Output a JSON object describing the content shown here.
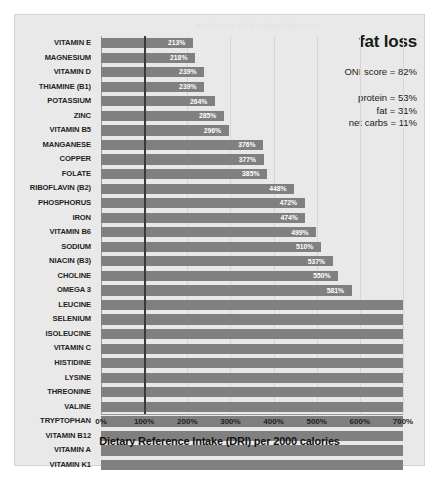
{
  "watermark": "nutrEbooters @ OptimisingNutrition.com",
  "annotations": {
    "title": "fat loss",
    "oni_score": "ONI score = 82%",
    "protein": "protein = 53%",
    "fat": "fat = 31%",
    "net_carbs": "net carbs = 11%"
  },
  "chart_data": {
    "type": "bar",
    "orientation": "horizontal",
    "title": "",
    "xlabel": "Dietary Reference Intake (DRI) per 2000 calories",
    "ylabel": "",
    "xlim": [
      0,
      700
    ],
    "grid": true,
    "reference_line": 100,
    "tick_labels": [
      "0%",
      "100%",
      "200%",
      "300%",
      "400%",
      "500%",
      "600%",
      "700%"
    ],
    "ticks": [
      0,
      100,
      200,
      300,
      400,
      500,
      600,
      700
    ],
    "bar_color": "#808080",
    "label_color": "#ffffff",
    "categories": [
      "VITAMIN E",
      "MAGNESIUM",
      "VITAMIN D",
      "THIAMINE (B1)",
      "POTASSIUM",
      "ZINC",
      "VITAMIN B5",
      "MANGANESE",
      "COPPER",
      "FOLATE",
      "RIBOFLAVIN (B2)",
      "PHOSPHORUS",
      "IRON",
      "VITAMIN B6",
      "SODIUM",
      "NIACIN (B3)",
      "CHOLINE",
      "OMEGA 3",
      "LEUCINE",
      "SELENIUM",
      "ISOLEUCINE",
      "VITAMIN C",
      "HISTIDINE",
      "LYSINE",
      "THREONINE",
      "VALINE",
      "TRYPTOPHAN",
      "VITAMIN B12",
      "VITAMIN A",
      "VITAMIN K1"
    ],
    "values": [
      213,
      218,
      239,
      239,
      264,
      285,
      296,
      376,
      377,
      385,
      448,
      472,
      474,
      499,
      510,
      537,
      550,
      581,
      700,
      700,
      700,
      700,
      700,
      700,
      700,
      700,
      700,
      700,
      700,
      700
    ],
    "data_labels": [
      "213%",
      "218%",
      "239%",
      "239%",
      "264%",
      "285%",
      "296%",
      "376%",
      "377%",
      "385%",
      "448%",
      "472%",
      "474%",
      "499%",
      "510%",
      "537%",
      "550%",
      "581%",
      "",
      "",
      "",
      "",
      "",
      "",
      "",
      "",
      "",
      "",
      "",
      ""
    ]
  }
}
